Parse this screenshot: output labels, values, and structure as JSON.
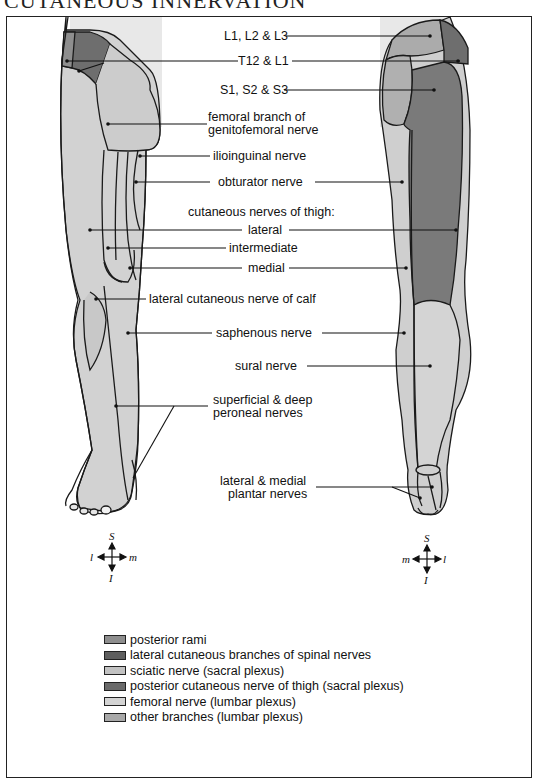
{
  "title": "CUTANEOUS INNERVATION",
  "colors": {
    "posterior_rami": "#8e8e8e",
    "lateral_cutaneous_branches": "#6e6e6e",
    "sciatic": "#c2c2c2",
    "posterior_cutaneous_thigh": "#7a7a7a",
    "femoral": "#d0d0d0",
    "other_branches": "#aaaaaa",
    "skin_background": "#e6e6e6",
    "outline": "#1a1a1a"
  },
  "labels": {
    "l1_l2_l3": "L1, L2 & L3",
    "t12_l1": "T12 & L1",
    "s1_s2_s3": "S1, S2 & S3",
    "femoral_branch_1": "femoral branch of",
    "femoral_branch_2": "genitofemoral nerve",
    "ilioinguinal": "ilioinguinal nerve",
    "obturator": "obturator nerve",
    "cutaneous_thigh": "cutaneous nerves of thigh:",
    "lateral": "lateral",
    "intermediate": "intermediate",
    "medial": "medial",
    "lateral_calf": "lateral cutaneous nerve of calf",
    "saphenous": "saphenous nerve",
    "sural": "sural nerve",
    "peroneal_1": "superficial & deep",
    "peroneal_2": "peroneal nerves",
    "plantar_1": "lateral & medial",
    "plantar_2": "plantar nerves"
  },
  "compass": {
    "left": {
      "top": "S",
      "bottom": "I",
      "left": "l",
      "right": "m"
    },
    "right": {
      "top": "S",
      "bottom": "I",
      "left": "m",
      "right": "l"
    }
  },
  "legend": [
    {
      "label": "posterior rami",
      "color": "#8e8e8e"
    },
    {
      "label": "lateral cutaneous branches of spinal nerves",
      "color": "#5e5e5e"
    },
    {
      "label": "sciatic nerve (sacral plexus)",
      "color": "#c2c2c2"
    },
    {
      "label": "posterior cutaneous nerve of thigh (sacral plexus)",
      "color": "#6a6a6a"
    },
    {
      "label": "femoral nerve (lumbar plexus)",
      "color": "#d4d4d4"
    },
    {
      "label": "other branches (lumbar plexus)",
      "color": "#a8a8a8"
    }
  ]
}
